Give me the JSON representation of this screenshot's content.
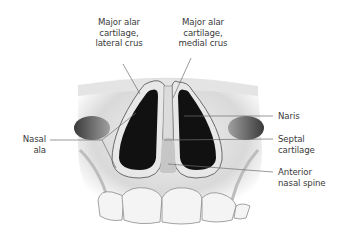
{
  "figure": {
    "labels": [
      {
        "id": "major-alar-lateral",
        "lines": [
          "Major alar",
          "cartilage,",
          "lateral crus"
        ]
      },
      {
        "id": "major-alar-medial",
        "lines": [
          "Major alar",
          "cartilage,",
          "medial crus"
        ]
      },
      {
        "id": "nasal-ala",
        "lines": [
          "Nasal",
          "ala"
        ]
      },
      {
        "id": "naris",
        "lines": [
          "Naris"
        ]
      },
      {
        "id": "septal-cartilage",
        "lines": [
          "Septal",
          "cartilage"
        ]
      },
      {
        "id": "anterior-nasal-spine",
        "lines": [
          "Anterior",
          "nasal spine"
        ]
      }
    ]
  }
}
